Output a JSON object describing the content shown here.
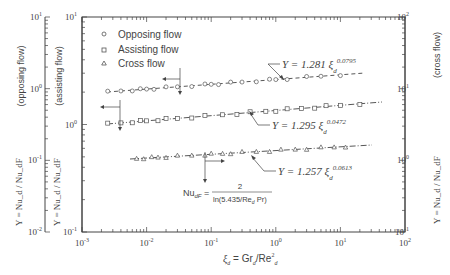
{
  "chart_data": {
    "type": "scatter",
    "title": "",
    "xlabel": "ξ_d = Gr_d / Re_d²",
    "x_scale": "log",
    "xlim": [
      0.001,
      100
    ],
    "x_ticks": [
      "10^-3",
      "10^-2",
      "10^-1",
      "10^0",
      "10^1",
      "10^2"
    ],
    "y_axes": [
      {
        "label": "Y = Nu_d / Nu_dF  (opposing flow)",
        "position": "far-left",
        "ylim": [
          0.01,
          10
        ],
        "ticks": [
          "10^-2",
          "10^-1",
          "10^0",
          "10^1"
        ]
      },
      {
        "label": "Y = Nu_d / Nu_dF  (assisting flow)",
        "position": "left",
        "ylim": [
          0.1,
          10
        ],
        "ticks": [
          "10^-1",
          "10^0",
          "10^1"
        ]
      },
      {
        "label": "Y = Nu_d / Nu_dF  (cross flow)",
        "position": "right",
        "ylim": [
          0.1,
          100
        ],
        "ticks": [
          "10^-1",
          "10^0",
          "10^1",
          "10^2"
        ]
      }
    ],
    "legend": [
      {
        "marker": "circle",
        "label": "Opposing flow"
      },
      {
        "marker": "square",
        "label": "Assisting flow"
      },
      {
        "marker": "triangle",
        "label": "Cross flow"
      }
    ],
    "legend_position": "upper-left",
    "grid": false,
    "series": [
      {
        "name": "Opposing flow (top band)",
        "fit": "Y = 1.281 ξ_d^0.0795",
        "coef": 1.281,
        "exp": 0.0795,
        "line": "dashed",
        "x": [
          0.0025,
          0.004,
          0.006,
          0.008,
          0.01,
          0.013,
          0.02,
          0.03,
          0.05,
          0.08,
          0.1,
          0.13,
          0.2,
          0.3,
          0.5,
          0.8,
          1.0,
          1.5,
          3,
          5,
          10
        ],
        "marker": "circle"
      },
      {
        "name": "Assisting flow (middle band)",
        "fit": "Y = 1.295 ξ_d^0.0472",
        "coef": 1.295,
        "exp": 0.0472,
        "line": "dash-dot",
        "x": [
          0.0025,
          0.004,
          0.006,
          0.008,
          0.01,
          0.015,
          0.02,
          0.03,
          0.05,
          0.08,
          0.15,
          0.25,
          0.4,
          0.7,
          1.0,
          1.5,
          2.5,
          4,
          6,
          10,
          20
        ],
        "marker": "square"
      },
      {
        "name": "Cross flow (bottom band)",
        "fit": "Y = 1.257 ξ_d^0.0613",
        "coef": 1.257,
        "exp": 0.0613,
        "line": "dash-dot",
        "x": [
          0.005,
          0.007,
          0.009,
          0.012,
          0.015,
          0.02,
          0.03,
          0.05,
          0.08,
          0.1,
          0.15,
          0.2,
          0.3,
          0.5,
          0.8,
          1.2,
          2,
          3,
          5,
          8,
          12
        ],
        "marker": "triangle"
      }
    ],
    "annotations": [
      "Y = 1.281 ξ_d^0.0795",
      "Y = 1.295 ξ_d^0.0472",
      "Y = 1.257 ξ_d^0.0613",
      "Nu_dF = 2 / ln(5.435 / Re_d Pr)"
    ]
  },
  "labels": {
    "far_left_axis_title": "Y = Nu_d / Nu_dF",
    "far_left_axis_sub": "(opposing flow)",
    "left_axis_sub": "(assisting flow)",
    "left_axis_title": "Y = Nu_d / Nu_dF",
    "right_axis_sub": "(cross flow)",
    "right_axis_title": "Y = Nu_d / Nu_dF",
    "legend_opposing": "Opposing flow",
    "legend_assisting": "Assisting flow",
    "legend_cross": "Cross flow",
    "fit_top": "Y = 1.281 ξ",
    "fit_top_exp": "0.0795",
    "fit_mid": "Y = 1.295 ξ",
    "fit_mid_exp": "0.0472",
    "fit_bot": "Y = 1.257 ξ",
    "fit_bot_exp": "0.0613",
    "nu_lhs": "Nu",
    "nu_lhs_sub": "dF",
    "nu_num": "2",
    "nu_den": "ln(5.435/Re",
    "nu_den_sub": "d",
    "nu_den_end": " Pr)",
    "x_title_xi": "ξ",
    "x_title_rest": " = Gr",
    "x_title_re": "/Re"
  }
}
